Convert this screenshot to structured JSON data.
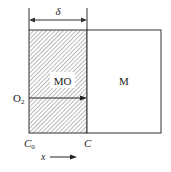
{
  "diagram": {
    "regions": [
      {
        "id": "oxide",
        "label": "MO",
        "hatched": true
      },
      {
        "id": "metal",
        "label": "M",
        "hatched": false
      }
    ],
    "dimension": {
      "label": "δ"
    },
    "flux": {
      "label": "O",
      "subscript": "2"
    },
    "concentrations": {
      "left": {
        "label": "C",
        "subscript": "0"
      },
      "right": {
        "label": "C"
      }
    },
    "axis": {
      "label": "x"
    },
    "colors": {
      "line": "#333333",
      "hatch": "#555555",
      "background": "#ffffff"
    }
  }
}
